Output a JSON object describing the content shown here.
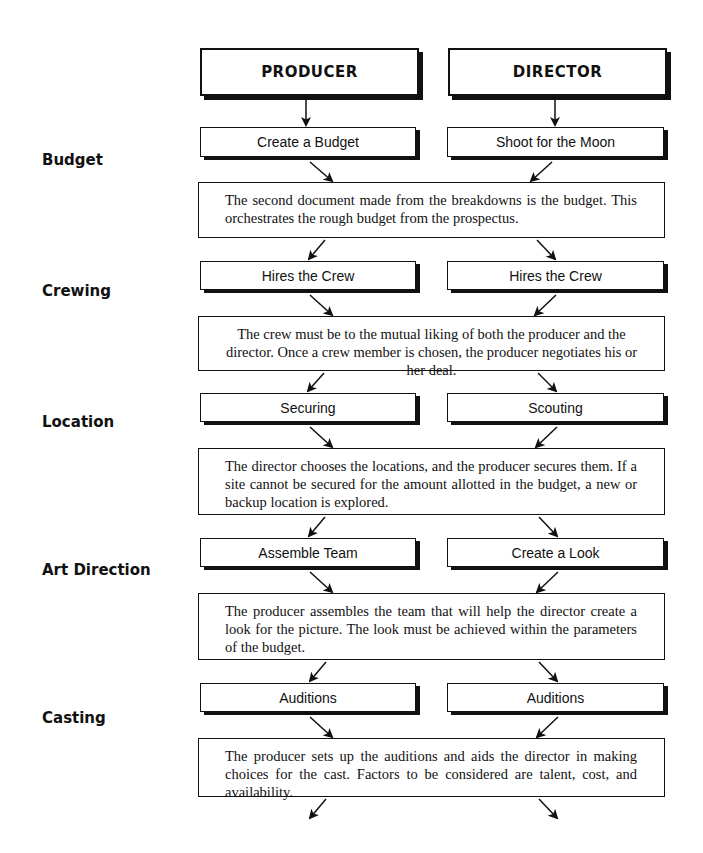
{
  "header": {
    "producer": "PRODUCER",
    "director": "DIRECTOR"
  },
  "sections": [
    {
      "label": "Budget",
      "producer_step": "Create a Budget",
      "director_step": "Shoot for the Moon",
      "note": "The second document made from the breakdowns is the budget. This orchestrates the rough budget from the prospectus."
    },
    {
      "label": "Crewing",
      "producer_step": "Hires the Crew",
      "director_step": "Hires the Crew",
      "note": "The crew must be to the mutual liking of both the producer and the director. Once a crew member is chosen, the producer negotiates his or her deal."
    },
    {
      "label": "Location",
      "producer_step": "Securing",
      "director_step": "Scouting",
      "note": "The director chooses the locations, and the producer secures them. If a site cannot be secured for the amount allotted in the budget, a new or backup location is explored."
    },
    {
      "label": "Art Direction",
      "producer_step": "Assemble Team",
      "director_step": "Create a Look",
      "note": "The producer assembles the team that will help the director create a look for the picture. The look must be achieved within the parameters of the budget."
    },
    {
      "label": "Casting",
      "producer_step": "Auditions",
      "director_step": "Auditions",
      "note": "The producer sets up the auditions and aids the director in making choices for the cast. Factors to be considered are talent, cost, and availability."
    }
  ]
}
